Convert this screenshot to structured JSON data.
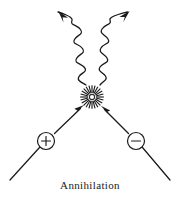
{
  "figure": {
    "caption": "Annihilation",
    "title": "Annihilation",
    "background_color": "#ffffff",
    "ink_color": "#1a1a1a"
  },
  "diagram": {
    "type": "particle-annihilation-schematic",
    "interaction_point": {
      "x": 92,
      "y": 97,
      "label": "annihilation-burst"
    },
    "particles": [
      {
        "name": "positron",
        "charge_symbol": "+",
        "circle": {
          "cx": 46,
          "cy": 141,
          "r": 8.5
        },
        "incoming_track": {
          "x1": 10,
          "y1": 180,
          "x2": 39,
          "y2": 148
        },
        "arrow_to_vertex": {
          "x1": 56,
          "y1": 132,
          "x2": 82,
          "y2": 107
        }
      },
      {
        "name": "electron",
        "charge_symbol": "−",
        "circle": {
          "cx": 136,
          "cy": 141,
          "r": 8.5
        },
        "incoming_track": {
          "x1": 170,
          "y1": 180,
          "x2": 143,
          "y2": 148
        },
        "arrow_to_vertex": {
          "x1": 127,
          "y1": 132,
          "x2": 103,
          "y2": 107
        }
      }
    ],
    "photons": [
      {
        "name": "photon-left",
        "direction": "up-left",
        "arrow_tip": {
          "x": 59,
          "y": 11
        },
        "origin": {
          "x": 86,
          "y": 85
        },
        "wave_cycles": 6
      },
      {
        "name": "photon-right",
        "direction": "up-right",
        "arrow_tip": {
          "x": 129,
          "y": 11
        },
        "origin": {
          "x": 100,
          "y": 85
        },
        "wave_cycles": 6
      }
    ],
    "burst": {
      "rays": 24,
      "outer_radius": 11.5,
      "core_radius": 2.6
    }
  }
}
